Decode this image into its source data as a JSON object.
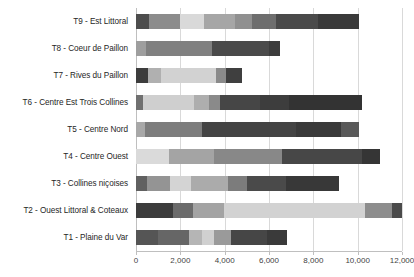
{
  "chart_data": {
    "type": "bar",
    "orientation": "horizontal",
    "stacked": true,
    "title": "",
    "subtitle": "",
    "xlabel": "",
    "ylabel": "",
    "xlim": [
      0,
      12000
    ],
    "ylim": null,
    "grid": "vertical",
    "legend": "none",
    "x_ticks": [
      0,
      2000,
      4000,
      6000,
      8000,
      10000,
      12000
    ],
    "x_tick_labels": [
      "0",
      "2,000",
      "4,000",
      "6,000",
      "8,000",
      "10,000",
      "12,000"
    ],
    "categories": [
      "T9 - Est Littoral",
      "T8 - Coeur de Paillon",
      "T7 - Rives du Paillon",
      "T6 - Centre Est Trois Collines",
      "T5 - Centre Nord",
      "T4 - Centre Ouest",
      "T3 - Collines niçoises",
      "T2 - Ouest Littoral & Coteaux",
      "T1 - Plaine du Var"
    ],
    "segment_colors": [
      "#595959",
      "#8c8c8c",
      "#b3b3b3",
      "#d9d9d9",
      "#a6a6a6",
      "#7f7f7f",
      "#4d4d4d",
      "#404040",
      "#333333"
    ],
    "bars": [
      {
        "category": "T9 - Est Littoral",
        "total": 10050,
        "segments": [
          {
            "value": 600,
            "color": "#4d4d4d"
          },
          {
            "value": 1400,
            "color": "#8c8c8c"
          },
          {
            "value": 1050,
            "color": "#d9d9d9"
          },
          {
            "value": 1400,
            "color": "#a6a6a6"
          },
          {
            "value": 800,
            "color": "#909090"
          },
          {
            "value": 1050,
            "color": "#6e6e6e"
          },
          {
            "value": 1900,
            "color": "#4a4a4a"
          },
          {
            "value": 1850,
            "color": "#3a3a3a"
          }
        ]
      },
      {
        "category": "T8 - Coeur de Paillon",
        "total": 6500,
        "segments": [
          {
            "value": 450,
            "color": "#9e9e9e"
          },
          {
            "value": 3000,
            "color": "#808080"
          },
          {
            "value": 2550,
            "color": "#4a4a4a"
          },
          {
            "value": 500,
            "color": "#3c3c3c"
          }
        ]
      },
      {
        "category": "T7 - Rives du Paillon",
        "total": 4800,
        "segments": [
          {
            "value": 550,
            "color": "#3d3d3d"
          },
          {
            "value": 600,
            "color": "#b0b0b0"
          },
          {
            "value": 2450,
            "color": "#d2d2d2"
          },
          {
            "value": 450,
            "color": "#8a8a8a"
          },
          {
            "value": 750,
            "color": "#3f3f3f"
          }
        ]
      },
      {
        "category": "T6 - Centre Est Trois Collines",
        "total": 10200,
        "segments": [
          {
            "value": 300,
            "color": "#707070"
          },
          {
            "value": 2300,
            "color": "#cfcfcf"
          },
          {
            "value": 700,
            "color": "#aeaeae"
          },
          {
            "value": 500,
            "color": "#8a8a8a"
          },
          {
            "value": 1800,
            "color": "#464646"
          },
          {
            "value": 1300,
            "color": "#3d3d3d"
          },
          {
            "value": 3300,
            "color": "#333333"
          }
        ]
      },
      {
        "category": "T5 - Centre Nord",
        "total": 10050,
        "segments": [
          {
            "value": 400,
            "color": "#a8a8a8"
          },
          {
            "value": 2600,
            "color": "#7d7d7d"
          },
          {
            "value": 4200,
            "color": "#444444"
          },
          {
            "value": 2050,
            "color": "#3a3a3a"
          },
          {
            "value": 800,
            "color": "#595959"
          }
        ]
      },
      {
        "category": "T4 - Centre Ouest",
        "total": 11000,
        "segments": [
          {
            "value": 1500,
            "color": "#dadada"
          },
          {
            "value": 2000,
            "color": "#a4a4a4"
          },
          {
            "value": 3100,
            "color": "#888888"
          },
          {
            "value": 3600,
            "color": "#474747"
          },
          {
            "value": 800,
            "color": "#353535"
          }
        ]
      },
      {
        "category": "T3 - Collines niçoises",
        "total": 9150,
        "segments": [
          {
            "value": 500,
            "color": "#606060"
          },
          {
            "value": 1050,
            "color": "#949494"
          },
          {
            "value": 950,
            "color": "#d4d4d4"
          },
          {
            "value": 1650,
            "color": "#ababab"
          },
          {
            "value": 850,
            "color": "#7c7c7c"
          },
          {
            "value": 1750,
            "color": "#4a4a4a"
          },
          {
            "value": 2400,
            "color": "#383838"
          }
        ]
      },
      {
        "category": "T2 - Ouest Littoral & Coteaux",
        "total": 12000,
        "segments": [
          {
            "value": 1650,
            "color": "#3c3c3c"
          },
          {
            "value": 900,
            "color": "#6b6b6b"
          },
          {
            "value": 1400,
            "color": "#a3a3a3"
          },
          {
            "value": 6400,
            "color": "#d2d2d2"
          },
          {
            "value": 1200,
            "color": "#8d8d8d"
          },
          {
            "value": 450,
            "color": "#4a4a4a"
          }
        ]
      },
      {
        "category": "T1 - Plaine du Var",
        "total": 6800,
        "segments": [
          {
            "value": 1000,
            "color": "#555555"
          },
          {
            "value": 1400,
            "color": "#666666"
          },
          {
            "value": 600,
            "color": "#b5b5b5"
          },
          {
            "value": 500,
            "color": "#d0d0d0"
          },
          {
            "value": 800,
            "color": "#9a9a9a"
          },
          {
            "value": 1600,
            "color": "#464646"
          },
          {
            "value": 900,
            "color": "#3a3a3a"
          }
        ]
      }
    ]
  }
}
